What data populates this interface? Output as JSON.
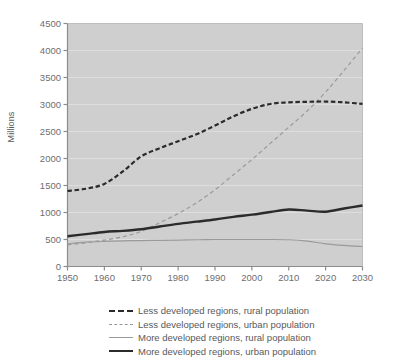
{
  "chart_data": {
    "type": "line",
    "title": "",
    "xlabel": "",
    "ylabel": "Millions",
    "xlim": [
      1950,
      2030
    ],
    "ylim": [
      0,
      4500
    ],
    "grid": true,
    "legend_position": "bottom",
    "x_ticks": [
      "1950",
      "1960",
      "1970",
      "1980",
      "1990",
      "2000",
      "2010",
      "2020",
      "2030"
    ],
    "y_ticks": [
      "0",
      "500",
      "1000",
      "1500",
      "2000",
      "2500",
      "3000",
      "3500",
      "4000",
      "4500"
    ],
    "x": [
      1950,
      1955,
      1960,
      1965,
      1970,
      1975,
      1980,
      1985,
      1990,
      1995,
      2000,
      2005,
      2010,
      2015,
      2020,
      2025,
      2030
    ],
    "series": [
      {
        "name": "Less developed regions, rural population",
        "style": "thick-dashed",
        "color": "#2b2b2b",
        "values": [
          1400,
          1440,
          1530,
          1760,
          2040,
          2190,
          2320,
          2450,
          2610,
          2780,
          2920,
          3010,
          3040,
          3050,
          3055,
          3040,
          3010
        ]
      },
      {
        "name": "Less developed regions, urban population",
        "style": "thin-dashed",
        "color": "#9a9a9a",
        "values": [
          400,
          440,
          490,
          550,
          650,
          810,
          980,
          1180,
          1420,
          1700,
          1980,
          2280,
          2580,
          2880,
          3230,
          3630,
          4050
        ]
      },
      {
        "name": "More developed regions, rural population",
        "style": "thin-solid",
        "color": "#9a9a9a",
        "values": [
          420,
          450,
          465,
          475,
          480,
          485,
          490,
          495,
          500,
          500,
          500,
          500,
          495,
          470,
          420,
          390,
          370
        ]
      },
      {
        "name": "More developed regions, urban population",
        "style": "thick-solid",
        "color": "#2b2b2b",
        "values": [
          560,
          600,
          640,
          660,
          690,
          740,
          790,
          830,
          870,
          920,
          960,
          1010,
          1055,
          1035,
          1015,
          1075,
          1130
        ]
      }
    ]
  },
  "legend": {
    "items": [
      {
        "label": "Less developed regions, rural population",
        "key": "thick-dashed"
      },
      {
        "label": "Less developed regions, urban population",
        "key": "thin-dashed"
      },
      {
        "label": "More developed regions, rural population",
        "key": "thin-solid"
      },
      {
        "label": "More developed regions, urban population",
        "key": "thick-solid"
      }
    ]
  },
  "colors": {
    "plot_background": "#cfcfcf",
    "gridline": "#dedede",
    "axis": "#8c8c8c",
    "dark_series": "#2b2b2b",
    "light_series": "#9a9a9a",
    "text": "#58595b"
  }
}
